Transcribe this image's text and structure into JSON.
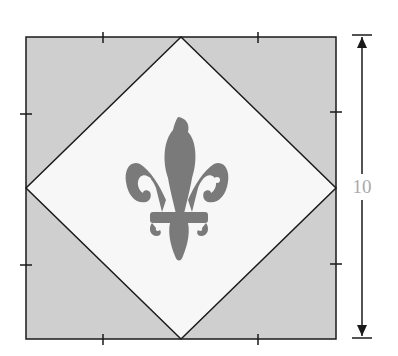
{
  "diagram": {
    "title": "",
    "dimension_label": "10",
    "colors": {
      "corner_fill": "#cfcfcf",
      "diamond_fill": "#f7f7f7",
      "motif": "#7a7a7a",
      "outline": "#1a1a1a",
      "label": "#aaaaaa"
    },
    "elements": [
      {
        "name": "outer-square",
        "type": "square"
      },
      {
        "name": "inner-diamond",
        "type": "diamond"
      },
      {
        "name": "fleur-de-lis",
        "type": "motif"
      },
      {
        "name": "dimension-arrow",
        "type": "vertical-arrow",
        "label": "10"
      }
    ],
    "tick_marks": {
      "per_side": 2
    }
  }
}
